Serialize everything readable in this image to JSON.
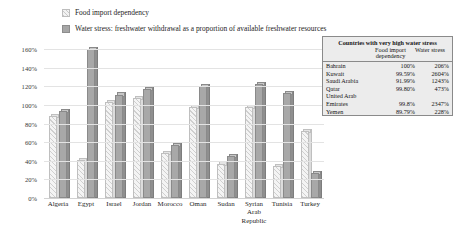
{
  "chart_data": {
    "type": "bar",
    "title": "",
    "xlabel": "",
    "ylabel": "",
    "ylim": [
      0,
      160
    ],
    "grid": true,
    "legend_position": "top-left",
    "categories": [
      "Algeria",
      "Egypt",
      "Israel",
      "Jordan",
      "Morocco",
      "Oman",
      "Sudan",
      "Syrian Arab Republic",
      "Tunisia",
      "Turkey"
    ],
    "ytick_labels": [
      "160%",
      "140%",
      "120%",
      "100%",
      "80%",
      "60%",
      "40%",
      "20%",
      "0%"
    ],
    "ytick_values": [
      160,
      140,
      120,
      100,
      80,
      60,
      40,
      20,
      0
    ],
    "series": [
      {
        "name": "Food import dependency",
        "style": "hatched",
        "values": [
          88,
          41,
          103,
          107,
          48,
          98,
          37,
          98,
          34,
          72
        ]
      },
      {
        "name": "Water stress: freshwater withdrawal as a proportion of available freshwater resources",
        "style": "solid",
        "values": [
          93,
          160,
          111,
          117,
          57,
          120,
          45,
          122,
          113,
          27
        ]
      }
    ]
  },
  "legend": {
    "items": [
      {
        "label": "Food import dependency",
        "marker": "hatched-square"
      },
      {
        "label": "Water stress: freshwater withdrawal as a proportion of available freshwater resources",
        "marker": "solid-square"
      }
    ]
  },
  "table": {
    "title": "Countries with very high water stress",
    "columns": [
      "",
      "Food import dependency",
      "Water stress"
    ],
    "rows": [
      {
        "country": "Bahrain",
        "food_import_dependency": "100%",
        "water_stress": "206%"
      },
      {
        "country": "Kuwait",
        "food_import_dependency": "99.59%",
        "water_stress": "2604%"
      },
      {
        "country": "Saudi Arabia",
        "food_import_dependency": "91.99%",
        "water_stress": "1243%"
      },
      {
        "country": "Qatar",
        "food_import_dependency": "99.80%",
        "water_stress": "473%"
      },
      {
        "country": "United Arab Emirates",
        "food_import_dependency": "99.8%",
        "water_stress": "2347%"
      },
      {
        "country": "Yemen",
        "food_import_dependency": "89.79%",
        "water_stress": "228%"
      }
    ]
  }
}
